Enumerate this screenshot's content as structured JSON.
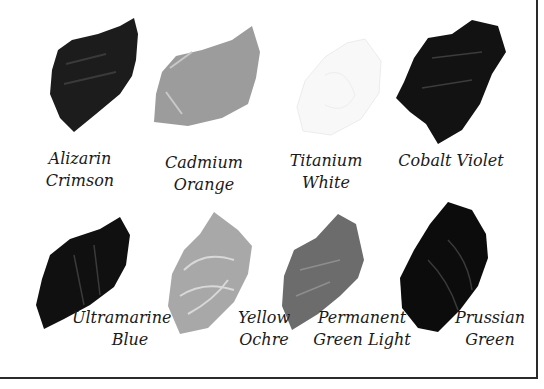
{
  "swatches": [
    {
      "name": "Alizarin Crimson",
      "line1": "Alizarin",
      "line2": "Crimson",
      "tone": "#1c1c1c"
    },
    {
      "name": "Cadmium Orange",
      "line1": "Cadmium",
      "line2": "Orange",
      "tone": "#9a9a9a"
    },
    {
      "name": "Titanium White",
      "line1": "Titanium",
      "line2": "White",
      "tone": "#f7f7f7"
    },
    {
      "name": "Cobalt Violet",
      "line1": "Cobalt Violet",
      "line2": "",
      "tone": "#121212"
    },
    {
      "name": "Ultramarine Blue",
      "line1": "Ultramarine",
      "line2": "Blue",
      "tone": "#101010"
    },
    {
      "name": "Yellow Ochre",
      "line1": "Yellow",
      "line2": "Ochre",
      "tone": "#a8a8a8"
    },
    {
      "name": "Permanent Green Light",
      "line1": "Permanent",
      "line2": "Green Light",
      "tone": "#6c6c6c"
    },
    {
      "name": "Prussian Green",
      "line1": "Prussian",
      "line2": "Green",
      "tone": "#0c0c0c"
    }
  ]
}
